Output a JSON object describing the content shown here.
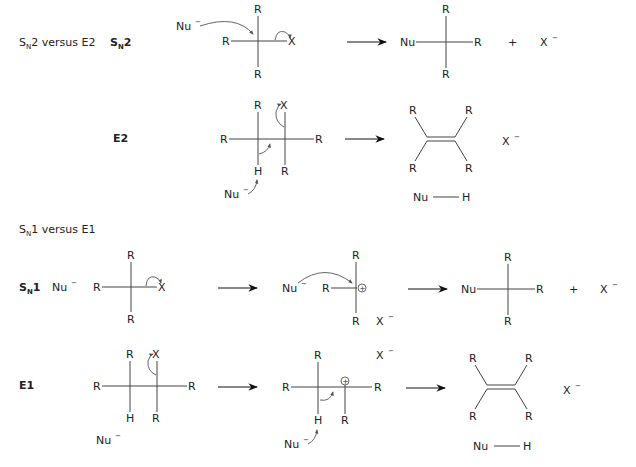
{
  "sections": {
    "sn2_e2": {
      "title_main": "S",
      "title_sub": "N",
      "title_rest": "2 versus E2",
      "sn2_label_main": "S",
      "sn2_label_sub": "N",
      "sn2_label_num": "2",
      "e2_label": "E2"
    },
    "sn1_e1": {
      "title_main": "S",
      "title_sub": "N",
      "title_rest": "1 versus E1",
      "sn1_label_main": "S",
      "sn1_label_sub": "N",
      "sn1_label_num": "1",
      "e1_label": "E1"
    }
  },
  "atoms": {
    "R": "R",
    "X": "X",
    "H": "H",
    "Nu": "Nu",
    "minus": "−",
    "plus": "+",
    "cation": "+"
  },
  "icons": {
    "reaction_arrow": "reaction-arrow-icon",
    "curly_arrow": "curly-arrow-icon",
    "positive_charge": "positive-charge-icon"
  },
  "colors": {
    "text": "#222222",
    "bond": "#444444",
    "background": "#ffffff"
  }
}
